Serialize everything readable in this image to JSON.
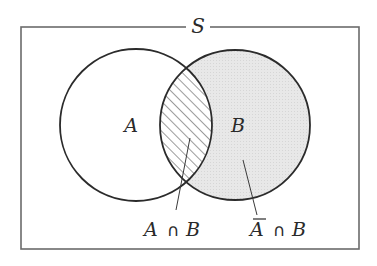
{
  "diagram": {
    "type": "venn",
    "universe_label": "S",
    "sets": [
      {
        "name": "A",
        "label": "A",
        "cx": 136,
        "cy": 125,
        "r": 76
      },
      {
        "name": "B",
        "label": "B",
        "cx": 235,
        "cy": 125,
        "r": 75
      }
    ],
    "regions": [
      {
        "name": "intersection",
        "label_left": "A",
        "operator": "∩",
        "label_right": "B",
        "fill": "hatched"
      },
      {
        "name": "complement-a-and-b",
        "label_left": "A",
        "label_left_overbar": true,
        "operator": "∩",
        "label_right": "B",
        "fill": "#e6e6e6"
      }
    ],
    "frame": {
      "x": 21,
      "y": 27,
      "width": 338,
      "height": 222,
      "stroke": "#6b6b6b"
    },
    "colors": {
      "circle_stroke": "#2b2b2b",
      "shade": "#e6e6e6",
      "hatch": "#4a4a4a"
    }
  }
}
